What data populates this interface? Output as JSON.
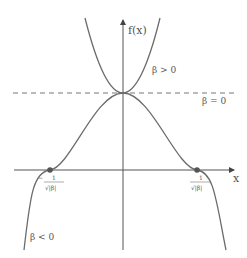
{
  "diagram": {
    "axes": {
      "y_label": "f(x)",
      "x_label": "x"
    },
    "curves": [
      {
        "name": "beta-positive",
        "label": "β > 0"
      },
      {
        "name": "beta-zero",
        "label": "β = 0"
      },
      {
        "name": "beta-negative",
        "label": "β < 0"
      }
    ],
    "points": [
      {
        "name": "left-root",
        "label_num": "1",
        "label_den": "√|β|",
        "sign": "−"
      },
      {
        "name": "right-root",
        "label_num": "1",
        "label_den": "√|β|",
        "sign": ""
      }
    ],
    "colors": {
      "curve": "#6b6b6b",
      "axis": "#555555",
      "dashed": "#777777"
    }
  }
}
